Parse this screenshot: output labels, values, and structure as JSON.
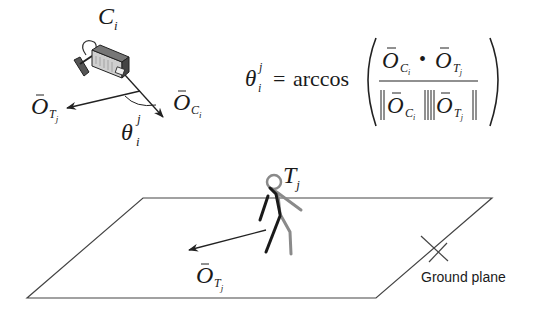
{
  "camera": {
    "label_main": "C",
    "label_sub": "i",
    "camera_vector": {
      "main": "O",
      "sub": "C",
      "subsub": "i"
    },
    "target_vector": {
      "main": "O",
      "sub": "T",
      "subsub": "j"
    },
    "angle": {
      "main": "θ",
      "sub": "i",
      "sup": "j"
    }
  },
  "formula": {
    "lhs": {
      "main": "θ",
      "sub": "i",
      "sup": "j"
    },
    "equals": "=",
    "func": "arccos",
    "numerator": {
      "left": {
        "main": "O",
        "sub": "C",
        "subsub": "i"
      },
      "op": "•",
      "right": {
        "main": "O",
        "sub": "T",
        "subsub": "j"
      }
    },
    "denominator": {
      "left": {
        "main": "O",
        "sub": "C",
        "subsub": "i"
      },
      "right": {
        "main": "O",
        "sub": "T",
        "subsub": "j"
      }
    }
  },
  "target": {
    "label_main": "T",
    "label_sub": "j",
    "heading_vector": {
      "main": "O",
      "sub": "T",
      "subsub": "j"
    }
  },
  "ground": {
    "label": "Ground plane"
  },
  "colors": {
    "line": "#333333",
    "figure_dark": "#1a1a1a",
    "figure_gray": "#8a8a8a",
    "camera_body": "#9a9a9a"
  }
}
